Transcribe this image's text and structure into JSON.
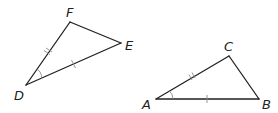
{
  "diagram": {
    "triangles": [
      {
        "name": "DEF",
        "vertices": [
          {
            "label": "F",
            "x": 70,
            "y": 22,
            "label_x": 66,
            "label_y": 17
          },
          {
            "label": "E",
            "x": 121,
            "y": 43,
            "label_x": 125,
            "label_y": 50
          },
          {
            "label": "D",
            "x": 26,
            "y": 85,
            "label_x": 14,
            "label_y": 100
          }
        ],
        "marks": {
          "DF": "double-tick",
          "DE": "single-tick",
          "angle_D": "single-arc"
        }
      },
      {
        "name": "ABC",
        "vertices": [
          {
            "label": "C",
            "x": 229,
            "y": 56,
            "label_x": 224,
            "label_y": 51
          },
          {
            "label": "A",
            "x": 156,
            "y": 99,
            "label_x": 142,
            "label_y": 109
          },
          {
            "label": "B",
            "x": 259,
            "y": 99,
            "label_x": 262,
            "label_y": 109
          }
        ],
        "marks": {
          "AC": "double-tick",
          "AB": "single-tick",
          "angle_A": "single-arc"
        }
      }
    ],
    "colors": {
      "line": "#231f20",
      "marks": "#8a8a8a",
      "background": "#ffffff"
    }
  }
}
